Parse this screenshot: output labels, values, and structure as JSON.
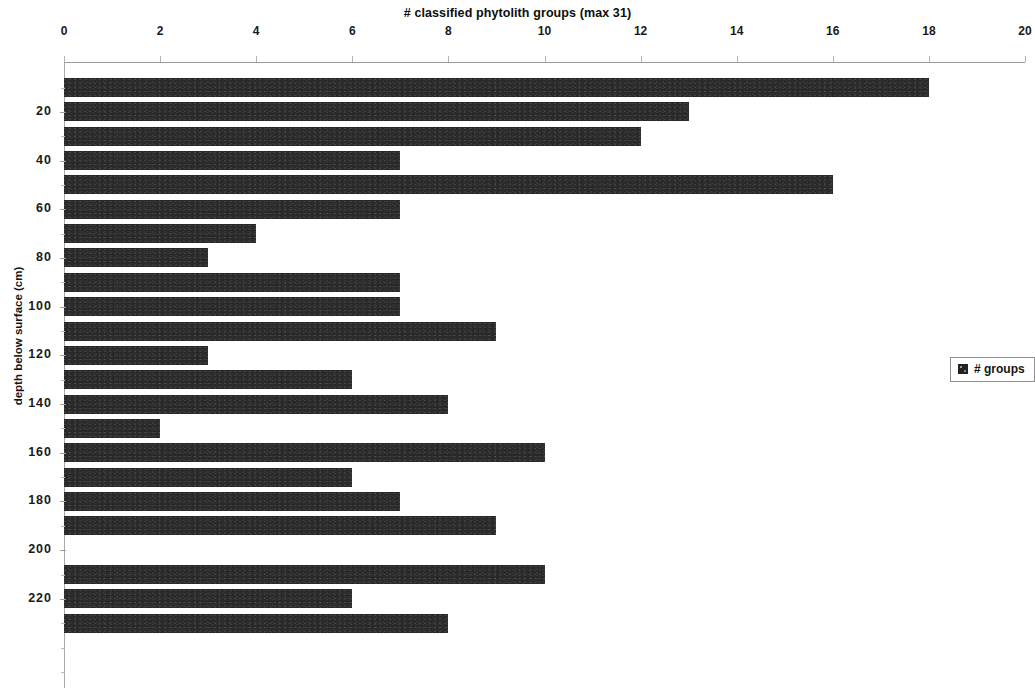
{
  "chart_data": {
    "type": "bar",
    "orientation": "horizontal",
    "title": "# classified phytolith groups (max 31)",
    "xlabel": "# classified phytolith groups (max 31)",
    "ylabel": "depth below surface (cm)",
    "xlim": [
      0,
      20
    ],
    "ylim": [
      0,
      245
    ],
    "x_ticks": [
      0,
      2,
      4,
      6,
      8,
      10,
      12,
      14,
      16,
      18,
      20
    ],
    "x_tick_labels": [
      "0",
      "2",
      "4",
      "6",
      "8",
      "10",
      "12",
      "14",
      "16",
      "18",
      "20"
    ],
    "y_ticks": [
      20,
      40,
      60,
      80,
      100,
      120,
      140,
      160,
      180,
      200,
      220
    ],
    "y_tick_labels": [
      "20",
      "40",
      "60",
      "80",
      "100",
      "120",
      "140",
      "160",
      "180",
      "200",
      "220"
    ],
    "grid": false,
    "legend_position": "right",
    "legend": [
      "# groups"
    ],
    "series": [
      {
        "name": "# groups",
        "color": "#2b2b2b",
        "categories": [
          10,
          20,
          30,
          40,
          50,
          60,
          70,
          80,
          90,
          100,
          110,
          120,
          130,
          140,
          150,
          160,
          170,
          180,
          190,
          200,
          210,
          220,
          230,
          240
        ],
        "values": [
          18,
          13,
          12,
          7,
          16,
          7,
          4,
          3,
          7,
          7,
          9,
          3,
          6,
          8,
          2,
          10,
          6,
          7,
          9,
          0,
          10,
          6,
          8,
          0
        ]
      }
    ],
    "bars": [
      {
        "depth_cm": 10,
        "value": 18
      },
      {
        "depth_cm": 20,
        "value": 13
      },
      {
        "depth_cm": 30,
        "value": 12
      },
      {
        "depth_cm": 40,
        "value": 7
      },
      {
        "depth_cm": 50,
        "value": 16
      },
      {
        "depth_cm": 60,
        "value": 7
      },
      {
        "depth_cm": 70,
        "value": 4
      },
      {
        "depth_cm": 80,
        "value": 3
      },
      {
        "depth_cm": 90,
        "value": 7
      },
      {
        "depth_cm": 100,
        "value": 7
      },
      {
        "depth_cm": 110,
        "value": 9
      },
      {
        "depth_cm": 120,
        "value": 3
      },
      {
        "depth_cm": 130,
        "value": 6
      },
      {
        "depth_cm": 140,
        "value": 8
      },
      {
        "depth_cm": 150,
        "value": 2
      },
      {
        "depth_cm": 160,
        "value": 10
      },
      {
        "depth_cm": 170,
        "value": 6
      },
      {
        "depth_cm": 180,
        "value": 7
      },
      {
        "depth_cm": 190,
        "value": 9
      },
      {
        "depth_cm": 200,
        "value": 0
      },
      {
        "depth_cm": 210,
        "value": 10
      },
      {
        "depth_cm": 220,
        "value": 6
      },
      {
        "depth_cm": 230,
        "value": 8
      },
      {
        "depth_cm": 240,
        "value": 0
      }
    ]
  },
  "legend": {
    "entry_label": "# groups"
  },
  "axes": {
    "x_title": "# classified phytolith groups (max 31)",
    "y_title": "depth below surface (cm)"
  }
}
